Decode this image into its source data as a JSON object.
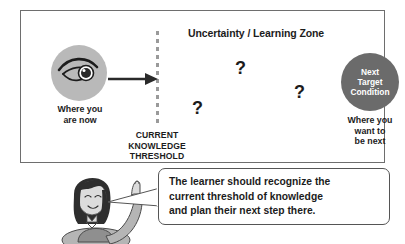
{
  "diagram": {
    "title": "Uncertainty / Learning Zone",
    "threshold": {
      "line1": "CURRENT",
      "line2": "KNOWLEDGE",
      "line3": "THRESHOLD"
    },
    "start": {
      "icon": "eye-icon",
      "caption_line1": "Where you",
      "caption_line2": "are now"
    },
    "target": {
      "label_line1": "Next",
      "label_line2": "Target",
      "label_line3": "Condition",
      "caption_line1": "Where you",
      "caption_line2": "want to",
      "caption_line3": "be next"
    },
    "question_marks": [
      "?",
      "?",
      "?"
    ],
    "arrow": "arrow-right-icon"
  },
  "speech_bubble": {
    "line1": "The learner should recognize the",
    "line2": "current threshold of knowledge",
    "line3": "and plan their next step there."
  },
  "colors": {
    "frame_border": "#6e6e6e",
    "eye_circle_fill": "#b9b9b9",
    "target_circle_fill": "#6b6b6b",
    "threshold_dash": "#9a9a9a",
    "text": "#1c1c1c",
    "bubble_border": "#555555",
    "hair": "#2e2e2e",
    "skin": "#dcdcdc",
    "shirt": "#8f8f8f"
  }
}
